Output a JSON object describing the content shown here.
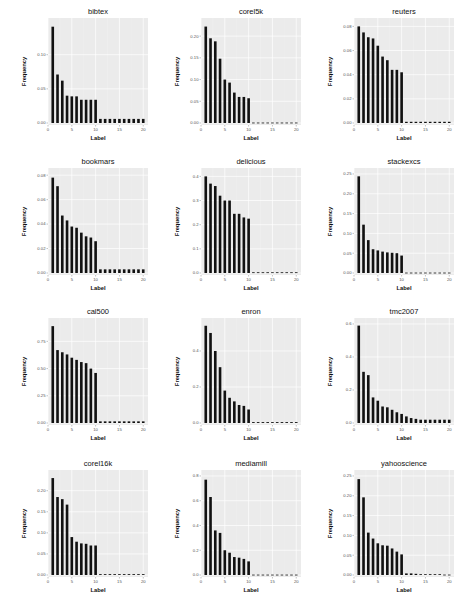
{
  "figure": {
    "layout": "4x3 grid of bar charts"
  },
  "colors": {
    "panel_bg": "#ebebeb",
    "grid_major": "#ffffff",
    "grid_minor": "#f3f3f3",
    "bar": "#111111"
  },
  "chart_data": [
    {
      "type": "bar",
      "title": "bibtex",
      "xlabel": "Label",
      "ylabel": "Frequency",
      "x": [
        1,
        2,
        3,
        4,
        5,
        6,
        7,
        8,
        9,
        10,
        11,
        12,
        13,
        14,
        15,
        16,
        17,
        18,
        19,
        20
      ],
      "values": [
        0.141,
        0.071,
        0.062,
        0.04,
        0.039,
        0.039,
        0.034,
        0.034,
        0.034,
        0.034,
        0.006,
        0.006,
        0.006,
        0.006,
        0.006,
        0.006,
        0.006,
        0.006,
        0.006,
        0.006
      ],
      "yticks": [
        0.0,
        0.05,
        0.1
      ],
      "ytick_labels": [
        "0.00",
        "0.05",
        "0.10"
      ],
      "ylim": [
        0,
        0.145
      ],
      "xticks": [
        0,
        5,
        10,
        15,
        20
      ],
      "xlim": [
        0,
        21
      ]
    },
    {
      "type": "bar",
      "title": "corel5k",
      "xlabel": "Label",
      "ylabel": "Frequency",
      "x": [
        1,
        2,
        3,
        4,
        5,
        6,
        7,
        8,
        9,
        10,
        11,
        12,
        13,
        14,
        15,
        16,
        17,
        18,
        19,
        20
      ],
      "values": [
        0.222,
        0.195,
        0.188,
        0.148,
        0.1,
        0.093,
        0.07,
        0.06,
        0.06,
        0.057,
        0.001,
        0.001,
        0.001,
        0.001,
        0.001,
        0.001,
        0.001,
        0.001,
        0.001,
        0.001
      ],
      "yticks": [
        0.0,
        0.05,
        0.1,
        0.15,
        0.2
      ],
      "ytick_labels": [
        "0.00",
        "0.05",
        "0.10",
        "0.15",
        "0.20"
      ],
      "ylim": [
        0,
        0.228
      ],
      "xticks": [
        0,
        5,
        10,
        15,
        20
      ],
      "xlim": [
        0,
        21
      ]
    },
    {
      "type": "bar",
      "title": "reuters",
      "xlabel": "Label",
      "ylabel": "Frequency",
      "x": [
        1,
        2,
        3,
        4,
        5,
        6,
        7,
        8,
        9,
        10,
        11,
        12,
        13,
        14,
        15,
        16,
        17,
        18,
        19,
        20
      ],
      "values": [
        0.08,
        0.075,
        0.071,
        0.07,
        0.064,
        0.055,
        0.052,
        0.044,
        0.044,
        0.042,
        0.001,
        0.001,
        0.001,
        0.001,
        0.001,
        0.001,
        0.001,
        0.001,
        0.001,
        0.001
      ],
      "yticks": [
        0.0,
        0.02,
        0.04,
        0.06,
        0.08
      ],
      "ytick_labels": [
        "0.00",
        "0.02",
        "0.04",
        "0.06",
        "0.08"
      ],
      "ylim": [
        0,
        0.082
      ],
      "xticks": [
        0,
        5,
        10,
        15,
        20
      ],
      "xlim": [
        0,
        21
      ]
    },
    {
      "type": "bar",
      "title": "bookmars",
      "xlabel": "Label",
      "ylabel": "Frequency",
      "x": [
        1,
        2,
        3,
        4,
        5,
        6,
        7,
        8,
        9,
        10,
        11,
        12,
        13,
        14,
        15,
        16,
        17,
        18,
        19,
        20
      ],
      "values": [
        0.078,
        0.071,
        0.047,
        0.043,
        0.038,
        0.037,
        0.033,
        0.03,
        0.029,
        0.026,
        0.003,
        0.003,
        0.003,
        0.003,
        0.003,
        0.003,
        0.003,
        0.003,
        0.003,
        0.003
      ],
      "yticks": [
        0.0,
        0.02,
        0.04,
        0.06,
        0.08
      ],
      "ytick_labels": [
        "0.00",
        "0.02",
        "0.04",
        "0.06",
        "0.08"
      ],
      "ylim": [
        0,
        0.081
      ],
      "xticks": [
        0,
        5,
        10,
        15,
        20
      ],
      "xlim": [
        0,
        21
      ]
    },
    {
      "type": "bar",
      "title": "delicious",
      "xlabel": "Label",
      "ylabel": "Frequency",
      "x": [
        1,
        2,
        3,
        4,
        5,
        6,
        7,
        8,
        9,
        10,
        11,
        12,
        13,
        14,
        15,
        16,
        17,
        18,
        19,
        20
      ],
      "values": [
        0.4,
        0.37,
        0.36,
        0.32,
        0.3,
        0.3,
        0.245,
        0.245,
        0.23,
        0.225,
        0.003,
        0.003,
        0.003,
        0.003,
        0.003,
        0.003,
        0.003,
        0.003,
        0.003,
        0.003
      ],
      "yticks": [
        0.0,
        0.1,
        0.2,
        0.3,
        0.4
      ],
      "ytick_labels": [
        "0.0",
        "0.1",
        "0.2",
        "0.3",
        "0.4"
      ],
      "ylim": [
        0,
        0.41
      ],
      "xticks": [
        0,
        5,
        10,
        15,
        20
      ],
      "xlim": [
        0,
        21
      ]
    },
    {
      "type": "bar",
      "title": "stackexcs",
      "xlabel": "Label",
      "ylabel": "Frequency",
      "x": [
        1,
        2,
        3,
        4,
        5,
        6,
        7,
        8,
        9,
        10,
        11,
        12,
        13,
        14,
        15,
        16,
        17,
        18,
        19,
        20
      ],
      "values": [
        0.244,
        0.122,
        0.083,
        0.06,
        0.057,
        0.054,
        0.052,
        0.051,
        0.05,
        0.044,
        0.001,
        0.001,
        0.001,
        0.001,
        0.001,
        0.001,
        0.001,
        0.001,
        0.001,
        0.001
      ],
      "yticks": [
        0.0,
        0.05,
        0.1,
        0.15,
        0.2,
        0.25
      ],
      "ytick_labels": [
        "0.00",
        "0.05",
        "0.10",
        "0.15",
        "0.20",
        "0.25"
      ],
      "ylim": [
        0,
        0.25
      ],
      "xticks": [
        0,
        5,
        10,
        15,
        20
      ],
      "xlim": [
        0,
        21
      ]
    },
    {
      "type": "bar",
      "title": "cal500",
      "xlabel": "Label",
      "ylabel": "Frequency",
      "x": [
        1,
        2,
        3,
        4,
        5,
        6,
        7,
        8,
        9,
        10,
        11,
        12,
        13,
        14,
        15,
        16,
        17,
        18,
        19,
        20
      ],
      "values": [
        0.89,
        0.67,
        0.65,
        0.63,
        0.6,
        0.58,
        0.56,
        0.55,
        0.5,
        0.46,
        0.015,
        0.015,
        0.015,
        0.015,
        0.015,
        0.015,
        0.015,
        0.015,
        0.015,
        0.015
      ],
      "yticks": [
        0.0,
        0.25,
        0.5,
        0.75
      ],
      "ytick_labels": [
        "0.00",
        "0.25",
        "0.50",
        "0.75"
      ],
      "ylim": [
        0,
        0.91
      ],
      "xticks": [
        0,
        5,
        10,
        15,
        20
      ],
      "xlim": [
        0,
        21
      ]
    },
    {
      "type": "bar",
      "title": "enron",
      "xlabel": "Label",
      "ylabel": "Frequency",
      "x": [
        1,
        2,
        3,
        4,
        5,
        6,
        7,
        8,
        9,
        10,
        11,
        12,
        13,
        14,
        15,
        16,
        17,
        18,
        19,
        20
      ],
      "values": [
        0.54,
        0.5,
        0.4,
        0.31,
        0.18,
        0.14,
        0.12,
        0.1,
        0.095,
        0.075,
        0.005,
        0.005,
        0.005,
        0.005,
        0.005,
        0.005,
        0.005,
        0.005,
        0.005,
        0.005
      ],
      "yticks": [
        0.0,
        0.2,
        0.4
      ],
      "ytick_labels": [
        "0.0",
        "0.2",
        "0.4"
      ],
      "ylim": [
        0,
        0.55
      ],
      "xticks": [
        0,
        5,
        10,
        15,
        20
      ],
      "xlim": [
        0,
        21
      ]
    },
    {
      "type": "bar",
      "title": "tmc2007",
      "xlabel": "Label",
      "ylabel": "Frequency",
      "x": [
        1,
        2,
        3,
        4,
        5,
        6,
        7,
        8,
        9,
        10,
        11,
        12,
        13,
        14,
        15,
        16,
        17,
        18,
        19,
        20
      ],
      "values": [
        0.59,
        0.31,
        0.29,
        0.155,
        0.135,
        0.1,
        0.095,
        0.08,
        0.065,
        0.055,
        0.04,
        0.03,
        0.025,
        0.02,
        0.02,
        0.02,
        0.02,
        0.02,
        0.02,
        0.02
      ],
      "yticks": [
        0.0,
        0.2,
        0.4,
        0.6
      ],
      "ytick_labels": [
        "0.0",
        "0.2",
        "0.4",
        "0.6"
      ],
      "ylim": [
        0,
        0.6
      ],
      "xticks": [
        0,
        5,
        10,
        15,
        20
      ],
      "xlim": [
        0,
        21
      ]
    },
    {
      "type": "bar",
      "title": "corel16k",
      "xlabel": "Label",
      "ylabel": "Frequency",
      "x": [
        1,
        2,
        3,
        4,
        5,
        6,
        7,
        8,
        9,
        10,
        11,
        12,
        13,
        14,
        15,
        16,
        17,
        18,
        19,
        20
      ],
      "values": [
        0.23,
        0.185,
        0.18,
        0.167,
        0.09,
        0.079,
        0.075,
        0.074,
        0.07,
        0.07,
        0.002,
        0.002,
        0.002,
        0.002,
        0.002,
        0.002,
        0.002,
        0.002,
        0.002,
        0.002
      ],
      "yticks": [
        0.0,
        0.05,
        0.1,
        0.15,
        0.2
      ],
      "ytick_labels": [
        "0.00",
        "0.05",
        "0.10",
        "0.15",
        "0.20"
      ],
      "ylim": [
        0,
        0.235
      ],
      "xticks": [
        0,
        5,
        10,
        15,
        20
      ],
      "xlim": [
        0,
        21
      ]
    },
    {
      "type": "bar",
      "title": "mediamill",
      "xlabel": "Label",
      "ylabel": "Frequency",
      "x": [
        1,
        2,
        3,
        4,
        5,
        6,
        7,
        8,
        9,
        10,
        11,
        12,
        13,
        14,
        15,
        16,
        17,
        18,
        19,
        20
      ],
      "values": [
        0.77,
        0.63,
        0.36,
        0.34,
        0.2,
        0.18,
        0.145,
        0.14,
        0.13,
        0.11,
        0.003,
        0.003,
        0.003,
        0.003,
        0.003,
        0.003,
        0.003,
        0.003,
        0.003,
        0.003
      ],
      "yticks": [
        0.0,
        0.2,
        0.4,
        0.6,
        0.8
      ],
      "ytick_labels": [
        "0.0",
        "0.2",
        "0.4",
        "0.6",
        "0.8"
      ],
      "ylim": [
        0,
        0.8
      ],
      "xticks": [
        0,
        5,
        10,
        15,
        20
      ],
      "xlim": [
        0,
        21
      ]
    },
    {
      "type": "bar",
      "title": "yahooscience",
      "xlabel": "Label",
      "ylabel": "Frequency",
      "x": [
        1,
        2,
        3,
        4,
        5,
        6,
        7,
        8,
        9,
        10,
        11,
        12,
        13,
        14,
        15,
        16,
        17,
        18,
        19,
        20
      ],
      "values": [
        0.242,
        0.196,
        0.107,
        0.092,
        0.08,
        0.075,
        0.074,
        0.067,
        0.059,
        0.052,
        0.004,
        0.004,
        0.003,
        0.002,
        0.002,
        0.002,
        0.002,
        0.002,
        0.001,
        0.001
      ],
      "yticks": [
        0.0,
        0.05,
        0.1,
        0.15,
        0.2,
        0.25
      ],
      "ytick_labels": [
        "0.00",
        "0.05",
        "0.10",
        "0.15",
        "0.20",
        "0.25"
      ],
      "ylim": [
        0,
        0.25
      ],
      "xticks": [
        0,
        5,
        10,
        15,
        20
      ],
      "xlim": [
        0,
        21
      ]
    }
  ]
}
